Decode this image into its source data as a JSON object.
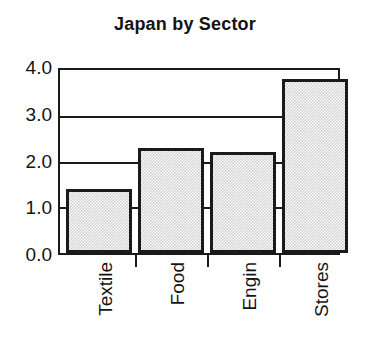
{
  "chart_data": {
    "type": "bar",
    "title": "Japan by Sector",
    "xlabel": "",
    "ylabel": "",
    "categories": [
      "Textile",
      "Food",
      "Engin",
      "Stores"
    ],
    "values": [
      1.4,
      2.3,
      2.2,
      3.8
    ],
    "ylim": [
      0.0,
      4.0
    ],
    "ytick_labels": [
      "0.0",
      "1.0",
      "2.0",
      "3.0",
      "4.0"
    ],
    "ytick_values": [
      0.0,
      1.0,
      2.0,
      3.0,
      4.0
    ],
    "grid": true,
    "grid_axis": "y",
    "legend": false,
    "legend_position": "none",
    "bar_fill_color": "#d6d6d6",
    "bar_edge_color": "#1a1a1a",
    "axis_color": "#1a1a1a",
    "background_color": "#ffffff",
    "xtick_label_rotation": 90
  }
}
